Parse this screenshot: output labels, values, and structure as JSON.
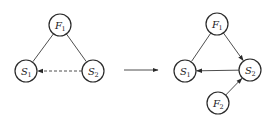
{
  "diagram": {
    "left_graph": {
      "nodes": [
        {
          "id": "F1",
          "base": "F",
          "sub": "1",
          "x": 60,
          "y": 25
        },
        {
          "id": "S1",
          "base": "S",
          "sub": "1",
          "x": 26,
          "y": 71
        },
        {
          "id": "S2",
          "base": "S",
          "sub": "2",
          "x": 93,
          "y": 71
        }
      ],
      "edges": [
        {
          "from": "F1",
          "to": "S1",
          "style": "solid",
          "arrow": false
        },
        {
          "from": "F1",
          "to": "S2",
          "style": "solid",
          "arrow": false
        },
        {
          "from": "S2",
          "to": "S1",
          "style": "dashed",
          "arrow": true
        }
      ]
    },
    "transition_arrow": {
      "from": [
        124,
        70
      ],
      "to": [
        158,
        70
      ]
    },
    "right_graph": {
      "nodes": [
        {
          "id": "F1",
          "base": "F",
          "sub": "1",
          "x": 217,
          "y": 24
        },
        {
          "id": "S1",
          "base": "S",
          "sub": "1",
          "x": 185,
          "y": 71
        },
        {
          "id": "S2",
          "base": "S",
          "sub": "2",
          "x": 250,
          "y": 70
        },
        {
          "id": "F2",
          "base": "F",
          "sub": "2",
          "x": 218,
          "y": 103
        }
      ],
      "edges": [
        {
          "from": "F1",
          "to": "S1",
          "style": "solid",
          "arrow": false
        },
        {
          "from": "F1",
          "to": "S2",
          "style": "solid",
          "arrow": true
        },
        {
          "from": "S2",
          "to": "S1",
          "style": "solid",
          "arrow": true
        },
        {
          "from": "F2",
          "to": "S2",
          "style": "solid",
          "arrow": true
        }
      ]
    },
    "node_radius": 11
  }
}
